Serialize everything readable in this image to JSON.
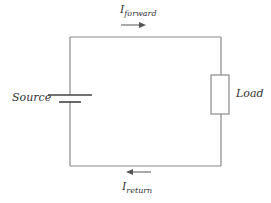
{
  "diagram": {
    "type": "circuit",
    "colors": {
      "wire": "#8a8a8a",
      "plate": "#444444",
      "arrow": "#555555",
      "text": "#333333"
    },
    "labels": {
      "source": "Source",
      "load": "Load",
      "forward_current": {
        "main": "I",
        "sub": "forward"
      },
      "return_current": {
        "main": "I",
        "sub": "return"
      }
    },
    "components": [
      {
        "id": "source",
        "kind": "battery"
      },
      {
        "id": "load",
        "kind": "resistor"
      }
    ],
    "arrows": [
      {
        "id": "forward",
        "direction": "right"
      },
      {
        "id": "return",
        "direction": "left"
      }
    ]
  }
}
